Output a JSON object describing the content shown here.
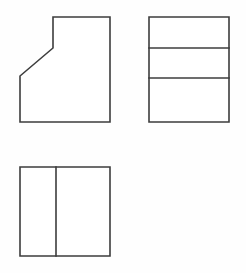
{
  "sheet": {
    "title": "Orthographic Multiview Drawing",
    "width": 246,
    "height": 273,
    "background_color": "#fefefe",
    "line_color": "#3d3d3d",
    "line_width": 1.6,
    "fill_color": "#ffffff"
  },
  "chart_data": {
    "type": "diagram",
    "diagram_kind": "orthographic-multiview-projection",
    "title": "",
    "xlabel": "",
    "ylabel": "",
    "units": "pixels",
    "view_count": 3,
    "views": [
      {
        "name": "front-view",
        "label": "",
        "position": "upper-left",
        "shape": "rectangle-with-chamfered-upper-left-corner",
        "bounds": {
          "x": 20,
          "y": 17,
          "width": 90,
          "height": 105
        },
        "vertices": [
          [
            53,
            17
          ],
          [
            110,
            17
          ],
          [
            110,
            122
          ],
          [
            20,
            122
          ],
          [
            20,
            76
          ],
          [
            53,
            48
          ]
        ],
        "interior_lines": [],
        "chamfer": {
          "from": [
            20,
            76
          ],
          "to": [
            53,
            48
          ],
          "run": 33,
          "rise": 28
        }
      },
      {
        "name": "right-side-view",
        "label": "",
        "position": "upper-right",
        "shape": "rectangle-with-two-horizontal-dividers",
        "bounds": {
          "x": 149,
          "y": 17,
          "width": 80,
          "height": 105
        },
        "vertices": [
          [
            149,
            17
          ],
          [
            229,
            17
          ],
          [
            229,
            122
          ],
          [
            149,
            122
          ]
        ],
        "interior_lines": [
          {
            "orientation": "horizontal",
            "from": [
              149,
              48
            ],
            "to": [
              229,
              48
            ]
          },
          {
            "orientation": "horizontal",
            "from": [
              149,
              78
            ],
            "to": [
              229,
              78
            ]
          }
        ],
        "band_heights": [
          31,
          30,
          44
        ]
      },
      {
        "name": "top-view",
        "label": "",
        "position": "lower-left",
        "shape": "rectangle-with-one-vertical-divider",
        "bounds": {
          "x": 20,
          "y": 167,
          "width": 90,
          "height": 89
        },
        "vertices": [
          [
            20,
            167
          ],
          [
            110,
            167
          ],
          [
            110,
            256
          ],
          [
            20,
            256
          ]
        ],
        "interior_lines": [
          {
            "orientation": "vertical",
            "from": [
              56,
              167
            ],
            "to": [
              56,
              256
            ]
          }
        ],
        "band_widths": [
          36,
          54
        ]
      }
    ],
    "alignment_notes": [
      "front-view and top-view share left edge x=20 and right edge x=110",
      "front-view and right-side-view share top edge y=17 and bottom edge y=122",
      "front-view chamfer top vertex y=48 aligns with right-side-view first divider y=48"
    ]
  }
}
